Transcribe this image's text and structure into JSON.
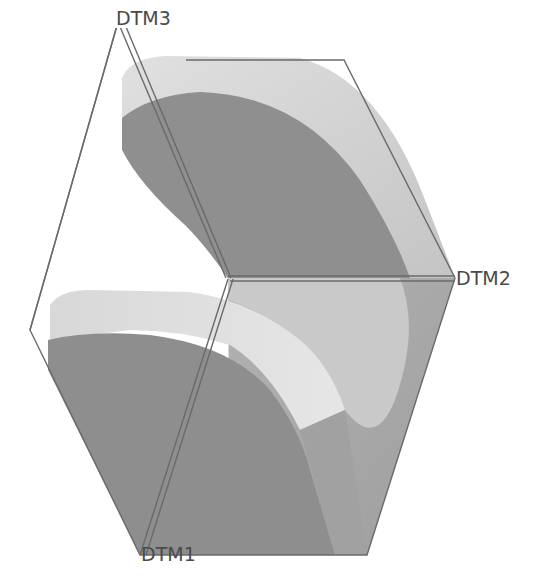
{
  "diagram": {
    "type": "cad-3d-part-view",
    "datum_planes": [
      {
        "id": "dtm3",
        "label": "DTM3"
      },
      {
        "id": "dtm2",
        "label": "DTM2"
      },
      {
        "id": "dtm1",
        "label": "DTM1"
      }
    ],
    "colors": {
      "background": "#ffffff",
      "face_dark": "#8f8f8f",
      "face_mid": "#a6a6a6",
      "face_light": "#d2d2d2",
      "face_highlight": "#e4e4e4",
      "datum_line": "#6a6a6a",
      "label": "#4a4a4a"
    }
  }
}
